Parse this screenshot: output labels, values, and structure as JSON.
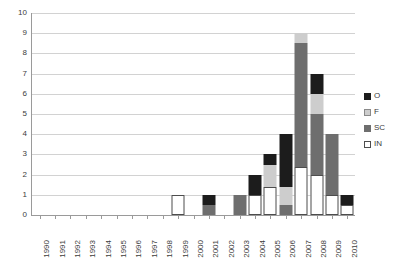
{
  "chart_data": {
    "type": "bar",
    "title": "",
    "subtitle": "",
    "xlabel": "",
    "ylabel": "",
    "stacked": true,
    "grid": true,
    "legend_position": "right",
    "ylim": [
      0,
      10
    ],
    "yticks": [
      "0",
      "1",
      "2",
      "3",
      "4",
      "5",
      "6",
      "7",
      "8",
      "9",
      "10"
    ],
    "categories": [
      "1990",
      "1991",
      "1992",
      "1993",
      "1994",
      "1995",
      "1996",
      "1997",
      "1998",
      "1999",
      "2000",
      "2001",
      "2002",
      "2003",
      "2004",
      "2005",
      "2006",
      "2007",
      "2008",
      "2009",
      "2010"
    ],
    "series": [
      {
        "name": "IN",
        "color": "#ffffff",
        "values": [
          0,
          0,
          0,
          0,
          0,
          0,
          0,
          0,
          0,
          1,
          0,
          0,
          0,
          0,
          1,
          1.4,
          0,
          2.4,
          2,
          1,
          0.5
        ]
      },
      {
        "name": "SC",
        "color": "#6e6e6e",
        "values": [
          0,
          0,
          0,
          0,
          0,
          0,
          0,
          0,
          0,
          0,
          0,
          0.5,
          0,
          1,
          0,
          0,
          0.5,
          6.1,
          3,
          3,
          0
        ]
      },
      {
        "name": "F",
        "color": "#cdcdcd",
        "values": [
          0,
          0,
          0,
          0,
          0,
          0,
          0,
          0,
          0,
          0,
          0,
          0,
          0,
          0,
          0,
          1.1,
          0.9,
          0.5,
          1,
          0,
          0
        ]
      },
      {
        "name": "O",
        "color": "#1c1c1c",
        "values": [
          0,
          0,
          0,
          0,
          0,
          0,
          0,
          0,
          0,
          0,
          0,
          0.5,
          0,
          0,
          1,
          0.5,
          2.6,
          0,
          1,
          0,
          0.5
        ]
      }
    ],
    "totals": [
      0,
      0,
      0,
      0,
      0,
      0,
      0,
      0,
      0,
      1,
      0,
      1,
      0,
      1,
      2,
      3,
      4,
      9,
      7,
      4,
      1
    ],
    "stack_order": [
      "IN",
      "SC",
      "F",
      "O"
    ]
  },
  "legend": {
    "entries": [
      {
        "label": "O",
        "color": "#1c1c1c"
      },
      {
        "label": "F",
        "color": "#cdcdcd"
      },
      {
        "label": "SC",
        "color": "#6e6e6e"
      },
      {
        "label": "IN",
        "color": "#ffffff"
      }
    ]
  }
}
